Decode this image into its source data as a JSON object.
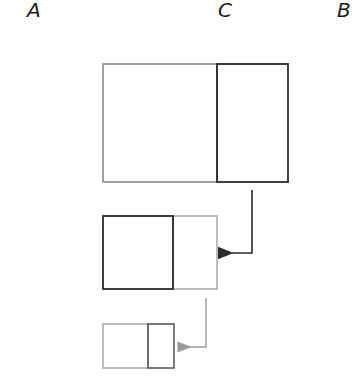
{
  "labels": {
    "a": "A",
    "c": "C",
    "b": "B",
    "edge_fragment": ":"
  },
  "colors": {
    "dark": "#2b2b2b",
    "gray": "#9a9a9a"
  },
  "diagram": {
    "levels": [
      {
        "name": "level-1",
        "outer": [
          103,
          64,
          288,
          182
        ],
        "divider_x": 217,
        "dark_part": "right"
      },
      {
        "name": "level-2",
        "outer": [
          103,
          216,
          217,
          289
        ],
        "divider_x": 173,
        "dark_part": "left"
      },
      {
        "name": "level-3",
        "outer": [
          103,
          324,
          174,
          368
        ],
        "divider_x": 148,
        "dark_part": "right"
      }
    ],
    "arrows": [
      {
        "name": "arrow-1-to-2",
        "color": "dark",
        "path": "252,190 252,253 228,253"
      },
      {
        "name": "arrow-2-to-3",
        "color": "gray",
        "path": "206,298 206,347 186,347"
      }
    ]
  }
}
